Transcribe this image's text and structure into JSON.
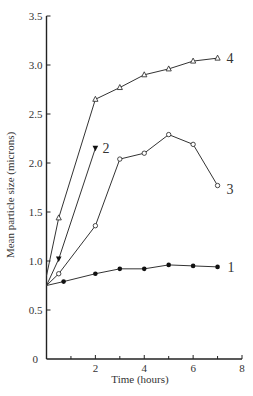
{
  "chart_data": {
    "type": "line",
    "title": "",
    "xlabel": "Time (hours)",
    "ylabel": "Mean particle size (microns)",
    "xlim": [
      0,
      8
    ],
    "ylim": [
      0,
      3.5
    ],
    "x_ticks": [
      0,
      2,
      4,
      6,
      8
    ],
    "x_tick_labels": [
      "0",
      "2",
      "4",
      "6",
      "8"
    ],
    "x_minor_ticks": [
      1,
      3,
      5,
      7
    ],
    "y_ticks": [
      0,
      0.5,
      1.0,
      1.5,
      2.0,
      2.5,
      3.0,
      3.5
    ],
    "y_tick_labels": [
      "0",
      "0.5",
      "1.0",
      "1.5",
      "2.0",
      "2.5",
      "3.0",
      "3.5"
    ],
    "grid": false,
    "legend": "inline curve labels",
    "series": [
      {
        "name": "1",
        "marker": "filled-circle",
        "x": [
          0,
          0.7,
          2,
          3,
          4,
          5,
          6,
          7
        ],
        "y": [
          0.75,
          0.79,
          0.87,
          0.92,
          0.92,
          0.96,
          0.95,
          0.94
        ]
      },
      {
        "name": "2",
        "marker": "filled-triangle-down",
        "x": [
          0,
          0.5,
          2
        ],
        "y": [
          0.75,
          1.02,
          2.15
        ]
      },
      {
        "name": "3",
        "marker": "open-circle",
        "x": [
          0,
          0.5,
          2,
          3,
          4,
          5,
          6,
          7
        ],
        "y": [
          0.75,
          0.87,
          1.36,
          2.04,
          2.1,
          2.29,
          2.19,
          1.77
        ]
      },
      {
        "name": "4",
        "marker": "open-triangle",
        "x": [
          0,
          0.5,
          2,
          3,
          4,
          5,
          6,
          7
        ],
        "y": [
          0.85,
          1.44,
          2.65,
          2.77,
          2.9,
          2.96,
          3.04,
          3.07
        ]
      }
    ]
  }
}
